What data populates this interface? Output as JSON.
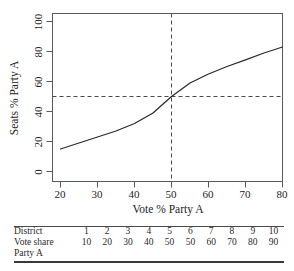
{
  "chart_data": {
    "type": "line",
    "title": "",
    "xlabel": "Vote % Party A",
    "ylabel": "Seats % Party A",
    "xlim": [
      14,
      84
    ],
    "ylim": [
      0,
      100
    ],
    "xticks": [
      20,
      30,
      40,
      50,
      60,
      70,
      80
    ],
    "yticks": [
      0,
      20,
      40,
      60,
      80,
      100
    ],
    "grid": false,
    "legend": "none",
    "series": [
      {
        "name": "Seats-votes curve",
        "x": [
          20,
          25,
          30,
          35,
          40,
          45,
          50,
          55,
          60,
          65,
          70,
          75,
          80
        ],
        "values": [
          15,
          19,
          23,
          27,
          32,
          39,
          50,
          59,
          65,
          70,
          74.5,
          79,
          83
        ]
      }
    ],
    "annotations": [
      {
        "name": "vertical-reference-line",
        "type": "vline",
        "x": 50,
        "style": "dashed"
      },
      {
        "name": "horizontal-reference-line",
        "type": "hline",
        "y": 50,
        "style": "dashed"
      }
    ]
  },
  "axes": {
    "x_title": "Vote % Party A",
    "y_title": "Seats % Party A",
    "x_tick_labels": [
      "20",
      "30",
      "40",
      "50",
      "60",
      "70",
      "80"
    ],
    "y_tick_labels": [
      "0",
      "20",
      "40",
      "60",
      "80",
      "100"
    ]
  },
  "table": {
    "rows": [
      {
        "label": "District",
        "values": [
          "1",
          "2",
          "3",
          "4",
          "5",
          "6",
          "7",
          "8",
          "9",
          "10"
        ]
      },
      {
        "label": "Vote share",
        "values": [
          "10",
          "20",
          "30",
          "40",
          "50",
          "50",
          "60",
          "70",
          "80",
          "90"
        ]
      },
      {
        "label": "Party A",
        "values": [
          "",
          "",
          "",
          "",
          "",
          "",
          "",
          "",
          "",
          ""
        ]
      }
    ]
  },
  "colors": {
    "curve": "#2b2b2b",
    "axis": "#4a4a4a",
    "dashed": "#4a4a4a",
    "text": "#232323"
  }
}
